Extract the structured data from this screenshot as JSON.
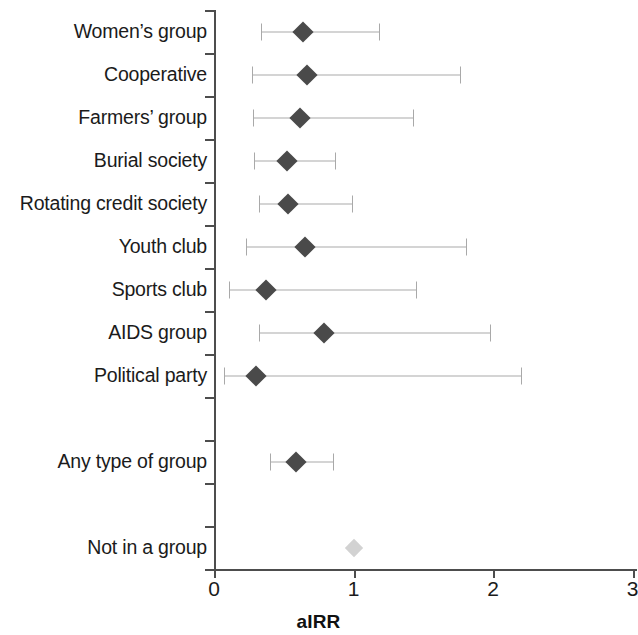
{
  "chart_data": {
    "type": "scatter",
    "subtype": "forest-plot",
    "title": "",
    "xlabel": "aIRR",
    "ylabel": "",
    "xlim": [
      0,
      3.03
    ],
    "xticks": [
      0,
      1,
      2,
      3
    ],
    "xtick_labels": [
      "0",
      "1",
      "2",
      "3"
    ],
    "grid": false,
    "legend": null,
    "reference_line": 1.0,
    "categories": [
      "Women's group",
      "Cooperative",
      "Farmers' group",
      "Burial society",
      "Rotating credit society",
      "Youth club",
      "Sports club",
      "AIDS group",
      "Political party",
      "",
      "Any type of group",
      "",
      "Not in a group"
    ],
    "rows": [
      {
        "label": "Women’s group",
        "estimate": 0.64,
        "ci_low": 0.34,
        "ci_high": 1.18,
        "reference": false,
        "spacer": false
      },
      {
        "label": "Cooperative",
        "estimate": 0.67,
        "ci_low": 0.27,
        "ci_high": 1.76,
        "reference": false,
        "spacer": false
      },
      {
        "label": "Farmers’ group",
        "estimate": 0.62,
        "ci_low": 0.28,
        "ci_high": 1.43,
        "reference": false,
        "spacer": false
      },
      {
        "label": "Burial society",
        "estimate": 0.52,
        "ci_low": 0.29,
        "ci_high": 0.87,
        "reference": false,
        "spacer": false
      },
      {
        "label": "Rotating credit society",
        "estimate": 0.53,
        "ci_low": 0.32,
        "ci_high": 0.99,
        "reference": false,
        "spacer": false
      },
      {
        "label": "Youth club",
        "estimate": 0.65,
        "ci_low": 0.23,
        "ci_high": 1.81,
        "reference": false,
        "spacer": false
      },
      {
        "label": "Sports club",
        "estimate": 0.37,
        "ci_low": 0.11,
        "ci_high": 1.45,
        "reference": false,
        "spacer": false
      },
      {
        "label": "AIDS group",
        "estimate": 0.79,
        "ci_low": 0.32,
        "ci_high": 1.98,
        "reference": false,
        "spacer": false
      },
      {
        "label": "Political party",
        "estimate": 0.3,
        "ci_low": 0.07,
        "ci_high": 2.2,
        "reference": false,
        "spacer": false
      },
      {
        "label": "",
        "estimate": null,
        "ci_low": null,
        "ci_high": null,
        "reference": false,
        "spacer": true
      },
      {
        "label": "Any type of group",
        "estimate": 0.59,
        "ci_low": 0.4,
        "ci_high": 0.85,
        "reference": false,
        "spacer": false
      },
      {
        "label": "",
        "estimate": null,
        "ci_low": null,
        "ci_high": null,
        "reference": false,
        "spacer": true
      },
      {
        "label": "Not in a group",
        "estimate": 1.0,
        "ci_low": null,
        "ci_high": null,
        "reference": true,
        "spacer": false
      }
    ]
  },
  "colors": {
    "point": "#4a4a4a",
    "reference_point": "#d2d2d2",
    "whisker": "#a9a9a9",
    "axis": "#4d4d4d",
    "text": "#1b1b1b"
  }
}
